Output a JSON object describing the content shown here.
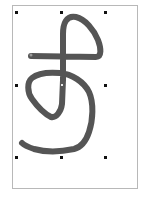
{
  "canvas": {
    "page_border_color": "#b8b8b8",
    "background_color": "#ffffff"
  },
  "stroke": {
    "color": "#555555",
    "width": 6,
    "selected": true
  },
  "selection": {
    "handle_color": "#111111",
    "handles": [
      {
        "name": "top-left",
        "x": 15,
        "y": 11
      },
      {
        "name": "top-center",
        "x": 60,
        "y": 11
      },
      {
        "name": "top-right",
        "x": 104,
        "y": 11
      },
      {
        "name": "middle-left",
        "x": 15,
        "y": 84
      },
      {
        "name": "middle-right",
        "x": 104,
        "y": 84
      },
      {
        "name": "bottom-left",
        "x": 15,
        "y": 156
      },
      {
        "name": "bottom-center",
        "x": 60,
        "y": 156
      },
      {
        "name": "bottom-right",
        "x": 104,
        "y": 156
      }
    ]
  }
}
